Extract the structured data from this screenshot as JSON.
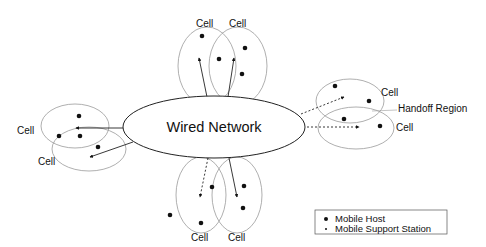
{
  "diagram": {
    "center": {
      "label": "Wired Network"
    },
    "cell_label": "Cell",
    "handoff_label": "Handoff Region",
    "cells": [
      {
        "id": "top-left",
        "label": "Cell"
      },
      {
        "id": "top-right",
        "label": "Cell"
      },
      {
        "id": "right-top",
        "label": "Cell"
      },
      {
        "id": "right-bottom",
        "label": "Cell"
      },
      {
        "id": "left-top",
        "label": "Cell"
      },
      {
        "id": "left-bottom",
        "label": "Cell"
      },
      {
        "id": "bottom-left",
        "label": "Cell"
      },
      {
        "id": "bottom-right",
        "label": "Cell"
      }
    ],
    "legend": {
      "items": [
        {
          "symbol": "large-dot",
          "label": "Mobile Host"
        },
        {
          "symbol": "small-dot",
          "label": "Mobile Support Station"
        }
      ]
    },
    "colors": {
      "cell_stroke": "#9a9a9a",
      "line": "#222222",
      "background": "#ffffff"
    }
  }
}
